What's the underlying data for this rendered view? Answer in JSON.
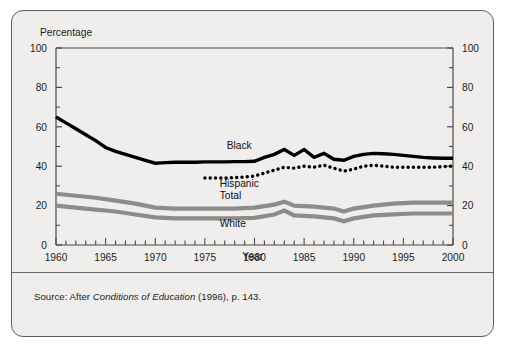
{
  "figure": {
    "background_color": "#efeeec",
    "border_color": "#5d5d5d",
    "y_axis_title": "Percentage",
    "x_axis_title": "Year",
    "source_prefix": "Source: After ",
    "source_italic": "Conditions of Education",
    "source_suffix": " (1996), p. 143."
  },
  "chart_data": {
    "type": "line",
    "title": "",
    "xlabel": "Year",
    "ylabel": "Percentage",
    "xlim": [
      1960,
      2000
    ],
    "ylim": [
      0,
      100
    ],
    "grid": false,
    "legend_position": "inline-labels",
    "y_ticks_major": [
      0,
      20,
      40,
      60,
      80,
      100
    ],
    "y_ticks_minor": [
      10,
      30,
      50,
      70,
      90
    ],
    "x_ticks_major": [
      1960,
      1965,
      1970,
      1975,
      1980,
      1985,
      1990,
      1995,
      2000
    ],
    "x_tick_labels": [
      "1960",
      "1965",
      "1970",
      "1975",
      "1980",
      "1985",
      "1990",
      "1995",
      "2000"
    ],
    "y_tick_labels_left": [
      "0",
      "20",
      "40",
      "60",
      "80",
      "100"
    ],
    "y_tick_labels_right": [
      "0",
      "20",
      "40",
      "60",
      "80",
      "100"
    ],
    "dual_y_axis": true,
    "series": [
      {
        "name": "Black",
        "label": "Black",
        "color": "#000000",
        "style": "solid",
        "width": 3.4,
        "label_x": 1977.2,
        "label_y": 48.5,
        "x": [
          1960,
          1961,
          1962,
          1963,
          1964,
          1965,
          1966,
          1967,
          1968,
          1969,
          1970,
          1971,
          1972,
          1973,
          1974,
          1975,
          1976,
          1977,
          1978,
          1979,
          1980,
          1981,
          1982,
          1983,
          1984,
          1985,
          1986,
          1987,
          1988,
          1989,
          1990,
          1991,
          1992,
          1993,
          1994,
          1995,
          1996,
          1997,
          1998,
          1999,
          2000
        ],
        "values": [
          65.0,
          62.0,
          59.0,
          56.0,
          53.0,
          49.5,
          47.5,
          46.0,
          44.5,
          43.0,
          41.5,
          41.8,
          42.0,
          42.0,
          42.0,
          42.2,
          42.2,
          42.2,
          42.3,
          42.3,
          42.5,
          44.5,
          46.0,
          48.5,
          45.5,
          48.5,
          44.5,
          46.5,
          43.5,
          43.0,
          45.0,
          46.0,
          46.5,
          46.3,
          46.0,
          45.5,
          45.0,
          44.5,
          44.2,
          44.0,
          44.0
        ]
      },
      {
        "name": "Hispanic",
        "label": "Hispanic",
        "color": "#000000",
        "style": "dotted",
        "width": 3.4,
        "label_x": 1976.5,
        "label_y": 29.5,
        "x": [
          1975,
          1976,
          1977,
          1978,
          1979,
          1980,
          1981,
          1982,
          1983,
          1984,
          1985,
          1986,
          1987,
          1988,
          1989,
          1990,
          1991,
          1992,
          1993,
          1994,
          1995,
          1996,
          1997,
          1998,
          1999,
          2000
        ],
        "values": [
          34.0,
          34.0,
          34.0,
          34.2,
          34.5,
          35.0,
          36.5,
          38.0,
          39.5,
          39.0,
          40.0,
          39.5,
          40.5,
          39.0,
          37.5,
          38.5,
          40.0,
          40.5,
          40.0,
          39.5,
          39.5,
          39.5,
          39.5,
          39.5,
          39.8,
          40.0
        ]
      },
      {
        "name": "Total",
        "label": "Total",
        "color": "#8c8c8c",
        "style": "solid",
        "width": 4.2,
        "label_x": 1976.5,
        "label_y": 23.5,
        "x": [
          1960,
          1962,
          1964,
          1966,
          1968,
          1970,
          1972,
          1974,
          1976,
          1978,
          1980,
          1982,
          1983,
          1984,
          1986,
          1988,
          1989,
          1990,
          1992,
          1994,
          1996,
          1998,
          2000
        ],
        "values": [
          26.0,
          25.0,
          24.0,
          22.5,
          21.0,
          19.0,
          18.5,
          18.5,
          18.5,
          18.5,
          19.0,
          20.5,
          22.0,
          20.0,
          19.5,
          18.5,
          17.0,
          18.5,
          20.0,
          21.0,
          21.5,
          21.5,
          21.5
        ]
      },
      {
        "name": "White",
        "label": "White",
        "color": "#8c8c8c",
        "style": "solid",
        "width": 4.2,
        "label_x": 1976.5,
        "label_y": 9.0,
        "x": [
          1960,
          1962,
          1964,
          1966,
          1968,
          1970,
          1972,
          1974,
          1976,
          1978,
          1980,
          1982,
          1983,
          1984,
          1986,
          1988,
          1989,
          1990,
          1992,
          1994,
          1996,
          1998,
          2000
        ],
        "values": [
          20.0,
          19.0,
          18.0,
          17.0,
          15.5,
          14.0,
          13.5,
          13.5,
          13.5,
          13.5,
          13.8,
          15.5,
          17.5,
          15.0,
          14.5,
          13.5,
          12.0,
          13.5,
          15.0,
          15.5,
          16.0,
          16.0,
          16.0
        ]
      }
    ]
  }
}
